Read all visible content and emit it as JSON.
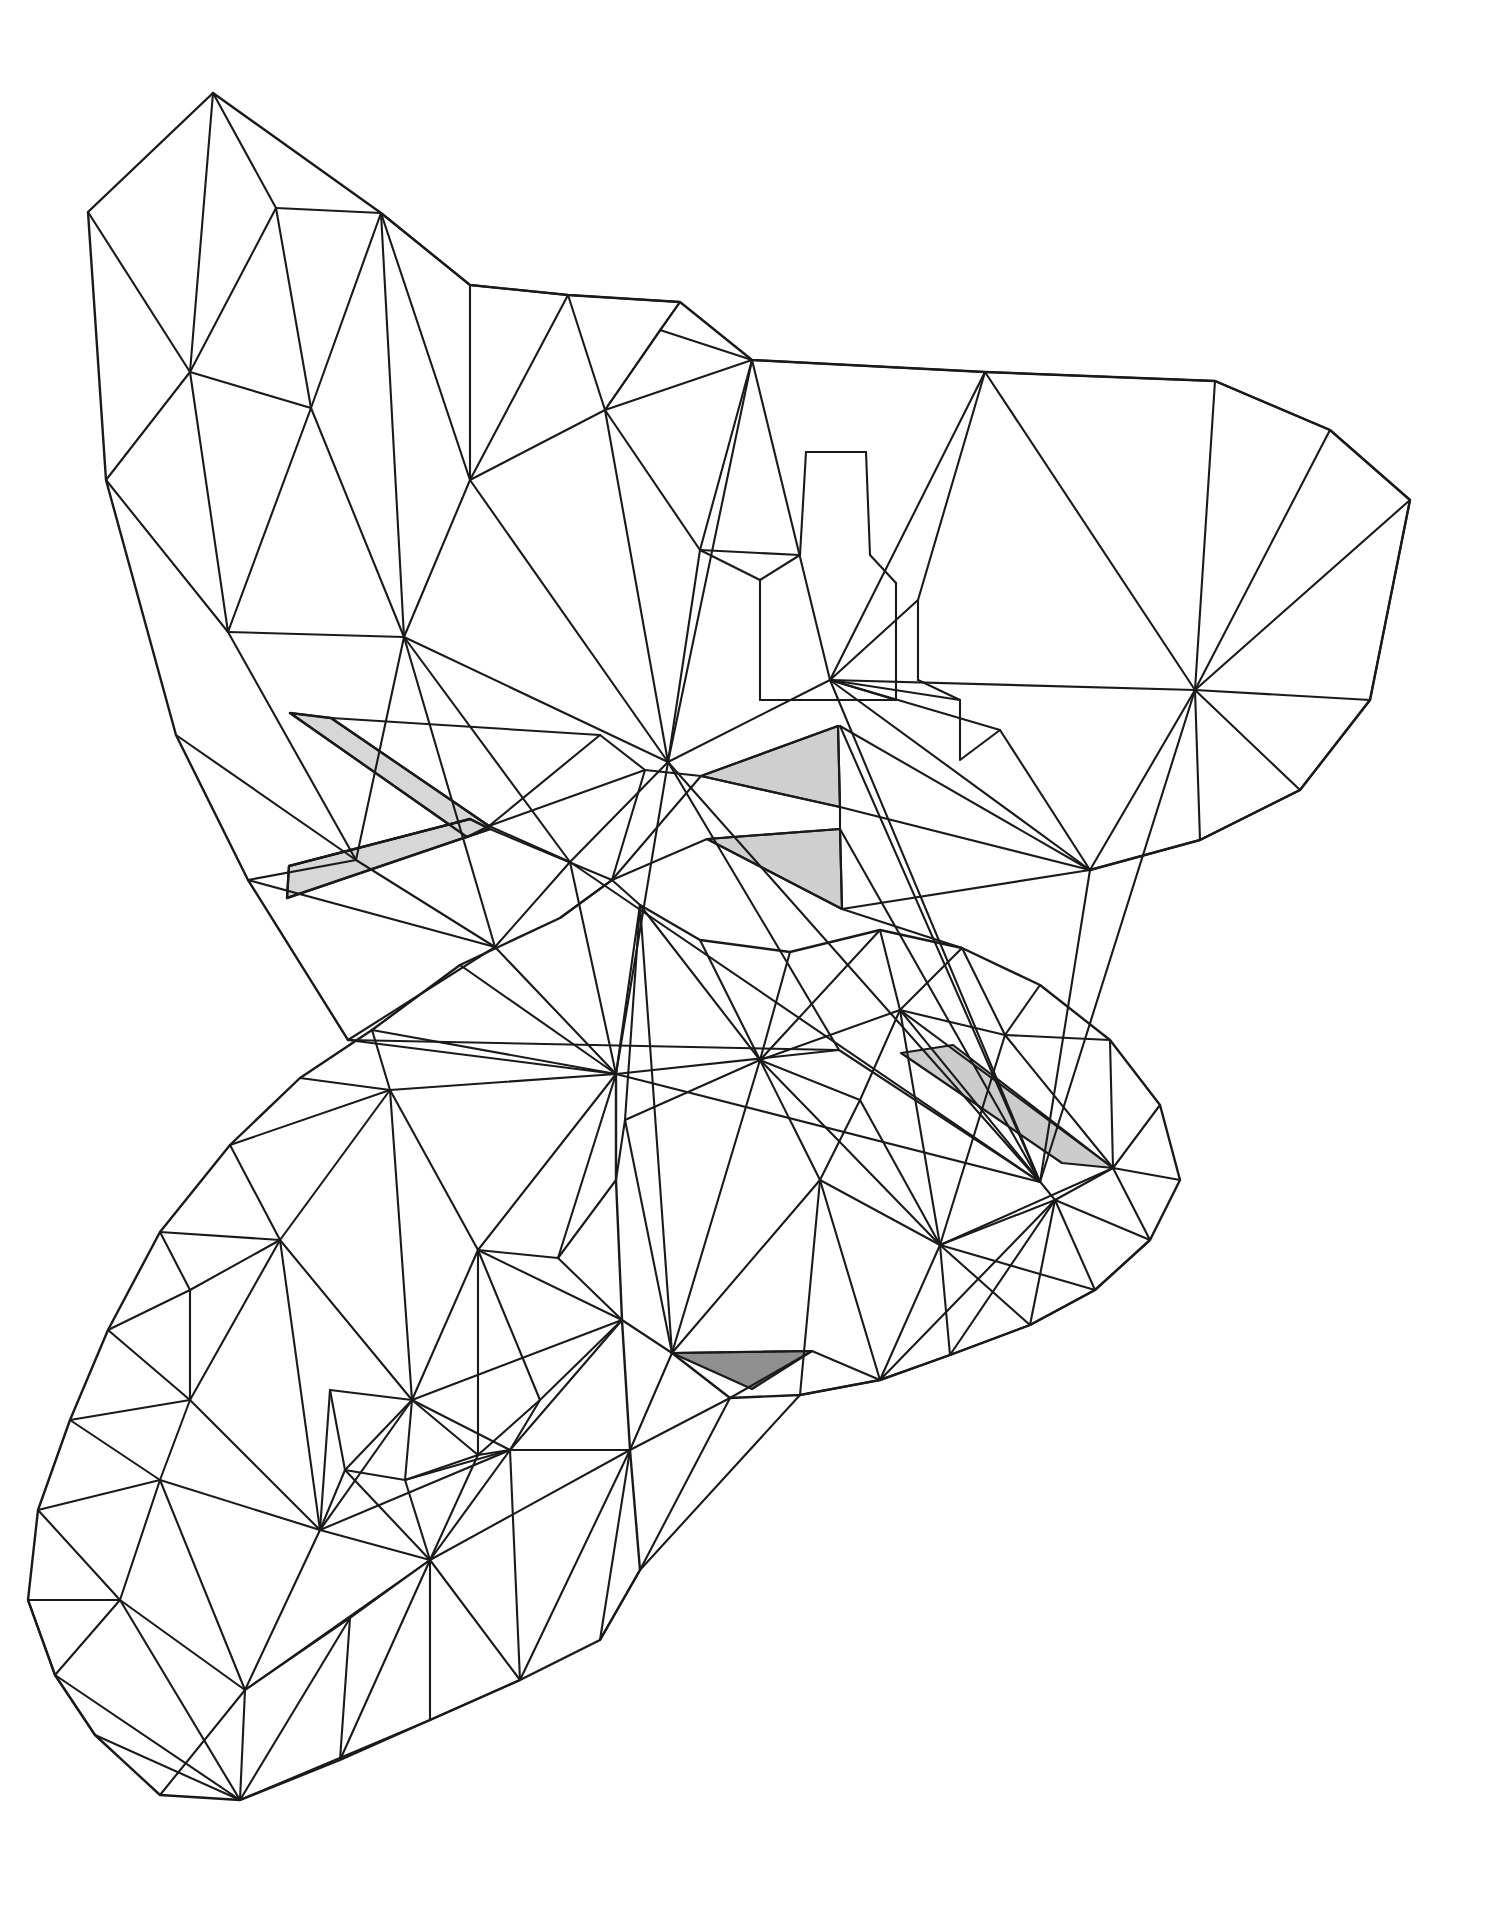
{
  "artwork": {
    "title": "Low-Poly Butterfly Line Drawing",
    "subject": "butterfly",
    "style": "low-poly triangulated wireframe",
    "background_color": "#ffffff",
    "line_color": "#1a1a1a",
    "line_width": 2.1,
    "canvas": {
      "width": 1486,
      "height": 1927
    }
  },
  "palette": {
    "ink": "#1a1a1a",
    "paper": "#ffffff",
    "shade_light": "#d7d7d7",
    "shade_mid": "#c9c9c9",
    "shade_dark": "#8f8f8f"
  },
  "parts": [
    {
      "id": "upper-left-wing",
      "label": "Upper Left Wing"
    },
    {
      "id": "upper-right-wing",
      "label": "Upper Right Wing"
    },
    {
      "id": "lower-left-wing",
      "label": "Lower Left Wing"
    },
    {
      "id": "lower-right-wing",
      "label": "Lower Right Wing"
    },
    {
      "id": "body",
      "label": "Body and Thorax"
    },
    {
      "id": "antennae",
      "label": "Antennae"
    }
  ],
  "shaded_faces": [
    {
      "id": "antenna-upper",
      "fill": "#d7d7d7",
      "points": "289,716 330,720 487,828 466,836"
    },
    {
      "id": "antenna-lower",
      "fill": "#d7d7d7",
      "points": "287,897 289,866 470,818 489,828"
    },
    {
      "id": "body-shade-upper",
      "fill": "#cfcfcf",
      "points": "700,775 838,726 840,806"
    },
    {
      "id": "body-shade-lower",
      "fill": "#cfcfcf",
      "points": "706,838 839,828 841,908"
    },
    {
      "id": "wing-shade-right",
      "fill": "#cccccc",
      "points": "902,1055 952,1046 1112,1167 1063,1163"
    },
    {
      "id": "wing-shade-bottom",
      "fill": "#8f8f8f",
      "points": "673,1352 810,1350 753,1387"
    }
  ],
  "geometry": {
    "upper_left_wing_outline": "63,55 140,102 211,154 290,168 390,205 470,228 560,243 601,295 625,370 625,447 630,535 645,600 648,700 638,745 600,735 520,700 455,663 390,615 330,570 270,520 218,470 170,420 128,370 100,300 72,230 55,150",
    "upper_right_wing_outline": "651,290 716,253 800,280 880,300 960,310 1045,320 1120,380 1168,455 1160,530 1140,600 1110,660 1060,700 1000,720 940,735 880,745 840,726",
    "lower_left_wing_outline": "380,895 300,975 215,1035 150,1110 100,1190 62,1280 40,1370 30,1460 45,1555 90,1620 150,1610 215,1555 280,1500 350,1480 420,1470 490,1450 560,1420 605,1390 612,1300 612,1150 600,1020 520,945",
    "lower_right_wing_outline": "640,905 700,940 780,950 860,930 950,950 1030,990 1090,1040 1145,1100 1175,1170 1150,1230 1100,1270 1040,1300 980,1330 900,1360 830,1380 760,1390 700,1380 655,1350",
    "body_outline": "289,716 487,828 600,735 645,770 700,775 838,726 841,908 706,838 612,880 520,860 287,897"
  },
  "annotations": {
    "shading_count": 6,
    "visible_text": ""
  }
}
